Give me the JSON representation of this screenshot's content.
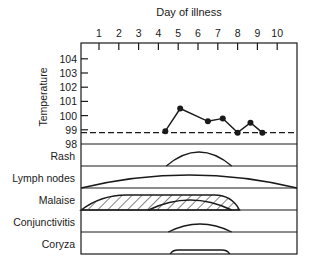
{
  "chart_data": {
    "type": "line",
    "title": "Day of illness",
    "xlabel": "Day of illness",
    "ylabel": "Temperature",
    "x_ticks": [
      "1",
      "2",
      "3",
      "4",
      "5",
      "6",
      "7",
      "8",
      "9",
      "10"
    ],
    "y_ticks": [
      "98",
      "99",
      "100",
      "101",
      "102",
      "103",
      "104"
    ],
    "xlim": [
      0.1,
      11.0
    ],
    "ylim": [
      98,
      104.6
    ],
    "baseline_temperature": 98.8,
    "series": [
      {
        "name": "Temperature",
        "x": [
          4.35,
          5.1,
          6.5,
          7.25,
          8.0,
          8.65,
          9.25
        ],
        "y": [
          98.9,
          100.5,
          99.6,
          99.8,
          98.8,
          99.5,
          98.8
        ]
      }
    ],
    "symptoms": [
      {
        "name": "Rash",
        "label": "Rash",
        "start": 4.4,
        "end": 7.7,
        "shape": "arc"
      },
      {
        "name": "Lymph nodes",
        "label": "Lymph nodes",
        "start": 0.1,
        "end": 11.0,
        "shape": "arc"
      },
      {
        "name": "Malaise",
        "label": "Malaise",
        "start": 0.1,
        "end": 8.1,
        "shape": "hatched-plateau",
        "inner": {
          "start": 3.5,
          "end": 7.7
        }
      },
      {
        "name": "Conjunctivitis",
        "label": "Conjunctivitis",
        "start": 4.5,
        "end": 7.7,
        "shape": "arc"
      },
      {
        "name": "Coryza",
        "label": "Coryza",
        "start": 4.6,
        "end": 7.6,
        "shape": "plateau"
      }
    ]
  }
}
